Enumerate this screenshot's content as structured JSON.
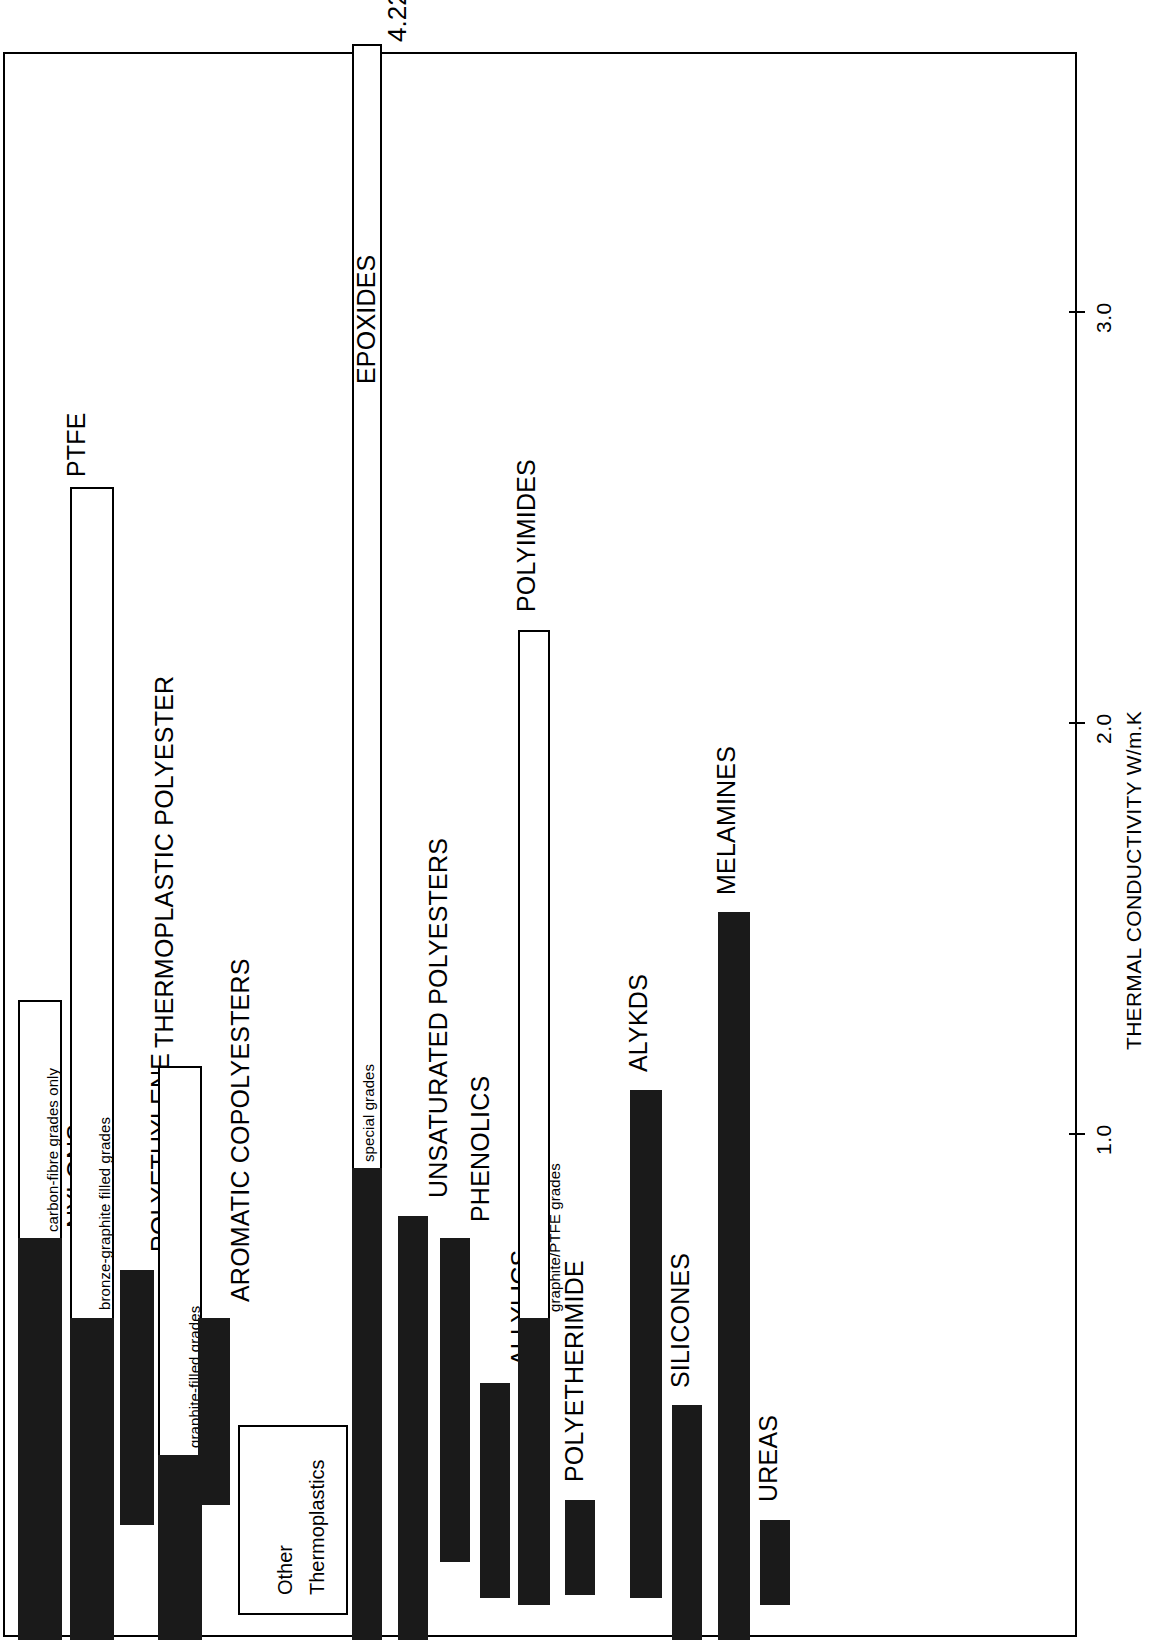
{
  "figure": {
    "axis_title": "THERMAL CONDUCTIVITY W/m.K",
    "peak_annotation": "4.22",
    "group_box": {
      "line1": "Other",
      "line2": "Thermoplastics"
    }
  },
  "chart_data": {
    "type": "bar",
    "title": "",
    "xlabel": "",
    "ylabel": "THERMAL CONDUCTIVITY W/m.K",
    "orientation": "vertical-rotated",
    "ylim": [
      0,
      3.55
    ],
    "grid": false,
    "legend": null,
    "tick_labels": [
      "1.0",
      "2.0",
      "3.0"
    ],
    "tick_values": [
      1.0,
      2.0,
      3.0
    ],
    "annotations": [
      {
        "text": "4.22",
        "series": "EPOXIDES",
        "note": "bar exceeds axis maximum"
      },
      {
        "text": "Other Thermoplastics",
        "note": "boxed group label between thermoplastic and thermoset bars"
      }
    ],
    "categories": [
      "NYLONS",
      "PTFE",
      "POLYETHYLENE",
      "THERMOPLASTIC POLYESTER",
      "AROMATIC COPOLYESTERS",
      "EPOXIDES",
      "UNSATURATED POLYESTERS",
      "PHENOLICS",
      "ALLYLICS",
      "POLYIMIDES",
      "POLYETHERIMIDE",
      "ALYKDS",
      "SILICONES",
      "MELAMINES",
      "UREAS"
    ],
    "series": [
      {
        "name": "standard grades (solid)",
        "values": [
          0.73,
          0.56,
          0.66,
          0.83,
          0.39,
          0.91,
          0.8,
          0.73,
          0.4,
          0.56,
          0.14,
          1.11,
          0.33,
          1.54,
          0.22
        ]
      },
      {
        "name": "special / filled grades (hollow extension)",
        "values": [
          2.08,
          2.54,
          0.0,
          1.5,
          0.0,
          4.22,
          0.0,
          0.0,
          0.0,
          2.23,
          0.0,
          0.0,
          0.0,
          0.0,
          0.0
        ]
      }
    ],
    "bars": [
      {
        "label": "NYLONS",
        "sub_label": "carbon-fibre grades only",
        "solid": 0.73,
        "hollow_top": 2.08
      },
      {
        "label": "PTFE",
        "sub_label": "bronze-graphite filled grades",
        "solid": 0.56,
        "hollow_top": 2.54
      },
      {
        "label": "POLYETHYLENE",
        "sub_label": "",
        "solid": 0.66,
        "hollow_top": 0.0
      },
      {
        "label": "THERMOPLASTIC POLYESTER",
        "sub_label": "graphite-filled grades",
        "solid": 0.83,
        "hollow_top": 1.5
      },
      {
        "label": "AROMATIC COPOLYESTERS",
        "sub_label": "",
        "solid": 0.39,
        "hollow_top": 0.0
      },
      {
        "label": "EPOXIDES",
        "sub_label": "special grades",
        "solid": 0.91,
        "hollow_top": 4.22
      },
      {
        "label": "UNSATURATED POLYESTERS",
        "sub_label": "",
        "solid": 0.8,
        "hollow_top": 0.0
      },
      {
        "label": "PHENOLICS",
        "sub_label": "",
        "solid": 0.73,
        "hollow_top": 0.0
      },
      {
        "label": "ALLYLICS",
        "sub_label": "",
        "solid": 0.4,
        "hollow_top": 0.0
      },
      {
        "label": "POLYIMIDES",
        "sub_label": "graphite/PTFE grades",
        "solid": 0.56,
        "hollow_top": 2.23
      },
      {
        "label": "POLYETHERIMIDE",
        "sub_label": "",
        "solid": 0.14,
        "hollow_top": 0.0
      },
      {
        "label": "ALYKDS",
        "sub_label": "",
        "solid": 1.11,
        "hollow_top": 0.0
      },
      {
        "label": "SILICONES",
        "sub_label": "",
        "solid": 0.33,
        "hollow_top": 0.0
      },
      {
        "label": "MELAMINES",
        "sub_label": "",
        "solid": 1.54,
        "hollow_top": 0.0
      },
      {
        "label": "UREAS",
        "sub_label": "",
        "solid": 0.22,
        "hollow_top": 0.0
      }
    ]
  },
  "layout": {
    "bar_geometry": [
      {
        "x": 18,
        "w": 44,
        "solid_top": 1238,
        "hollow_top": 1000,
        "bar_bottom": 1640,
        "label_x": 62,
        "label_y": 1238,
        "sub_x": 44,
        "sub_y": 1232
      },
      {
        "x": 70,
        "w": 44,
        "solid_top": 1318,
        "hollow_top": 487,
        "bar_bottom": 1640,
        "label_x": 62,
        "label_y": 487,
        "sub_x": 96,
        "sub_y": 1310
      },
      {
        "x": 120,
        "w": 34,
        "solid_top": 1270,
        "hollow_top": 0,
        "bar_bottom": 1525,
        "label_x": 146,
        "label_y": 1262,
        "sub_x": 0,
        "sub_y": 0
      },
      {
        "x": 158,
        "w": 44,
        "solid_top": 1455,
        "hollow_top": 1066,
        "bar_bottom": 1640,
        "label_x": 150,
        "label_y": 1058,
        "sub_x": 186,
        "sub_y": 1448
      },
      {
        "x": 198,
        "w": 32,
        "solid_top": 1318,
        "hollow_top": 0,
        "bar_bottom": 1505,
        "label_x": 226,
        "label_y": 1312,
        "sub_x": 0,
        "sub_y": 0
      },
      {
        "x": 352,
        "w": 30,
        "solid_top": 1168,
        "hollow_top": 44,
        "bar_bottom": 1640,
        "label_x": 352,
        "label_y": 394,
        "sub_x": 360,
        "sub_y": 1162
      },
      {
        "x": 398,
        "w": 30,
        "solid_top": 1216,
        "hollow_top": 0,
        "bar_bottom": 1640,
        "label_x": 424,
        "label_y": 1208,
        "sub_x": 0,
        "sub_y": 0
      },
      {
        "x": 440,
        "w": 30,
        "solid_top": 1238,
        "hollow_top": 0,
        "bar_bottom": 1562,
        "label_x": 466,
        "label_y": 1232,
        "sub_x": 0,
        "sub_y": 0
      },
      {
        "x": 480,
        "w": 30,
        "solid_top": 1383,
        "hollow_top": 0,
        "bar_bottom": 1598,
        "label_x": 506,
        "label_y": 1376,
        "sub_x": 0,
        "sub_y": 0
      },
      {
        "x": 518,
        "w": 32,
        "solid_top": 1318,
        "hollow_top": 630,
        "bar_bottom": 1605,
        "label_x": 512,
        "label_y": 622,
        "sub_x": 546,
        "sub_y": 1312
      },
      {
        "x": 565,
        "w": 30,
        "solid_top": 1500,
        "hollow_top": 0,
        "bar_bottom": 1595,
        "label_x": 560,
        "label_y": 1492,
        "sub_x": 0,
        "sub_y": 0
      },
      {
        "x": 630,
        "w": 32,
        "solid_top": 1090,
        "hollow_top": 0,
        "bar_bottom": 1598,
        "label_x": 624,
        "label_y": 1082,
        "sub_x": 0,
        "sub_y": 0
      },
      {
        "x": 672,
        "w": 30,
        "solid_top": 1405,
        "hollow_top": 0,
        "bar_bottom": 1640,
        "label_x": 666,
        "label_y": 1398,
        "sub_x": 0,
        "sub_y": 0
      },
      {
        "x": 718,
        "w": 32,
        "solid_top": 912,
        "hollow_top": 0,
        "bar_bottom": 1640,
        "label_x": 712,
        "label_y": 905,
        "sub_x": 0,
        "sub_y": 0
      },
      {
        "x": 760,
        "w": 30,
        "solid_top": 1520,
        "hollow_top": 0,
        "bar_bottom": 1605,
        "label_x": 754,
        "label_y": 1512,
        "sub_x": 0,
        "sub_y": 0
      }
    ],
    "ticks": [
      {
        "label": "1.0",
        "y": 1133
      },
      {
        "label": "2.0",
        "y": 722
      },
      {
        "label": "3.0",
        "y": 311
      }
    ],
    "group_box": {
      "x": 238,
      "y": 1425,
      "w": 110,
      "h": 190
    }
  }
}
